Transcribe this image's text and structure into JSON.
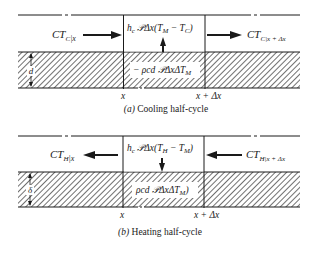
{
  "panels": [
    {
      "id": "cooling",
      "caption_letter": "(a)",
      "caption_text": " Cooling half-cycle",
      "left_flux": {
        "main": "CT",
        "sub": "C",
        "eval": "|x"
      },
      "right_flux": {
        "main": "CT",
        "sub": "C",
        "eval": "|x + Δx"
      },
      "convection_term": {
        "prefix": "h",
        "prefix_sub": "c",
        "body": " 𝒫Δx(T",
        "s1": "M",
        "mid": " − T",
        "s2": "C",
        "end": ")"
      },
      "storage_term": {
        "body": "− ρcd 𝒫ΔxΔT",
        "s1": "M",
        "end": ""
      },
      "flow_direction": "left-to-right",
      "heat_arrow": "up"
    },
    {
      "id": "heating",
      "caption_letter": "(b)",
      "caption_text": " Heating half-cycle",
      "left_flux": {
        "main": "CT",
        "sub": "H",
        "eval": "|x"
      },
      "right_flux": {
        "main": "CT",
        "sub": "H",
        "eval": "|x + Δx"
      },
      "convection_term": {
        "prefix": "h",
        "prefix_sub": "c",
        "body": " 𝒫Δx(T",
        "s1": "H",
        "mid": " − T",
        "s2": "M",
        "end": ")"
      },
      "storage_term": {
        "body": "ρcd 𝒫ΔxΔT",
        "s1": "M",
        "end": ")"
      },
      "flow_direction": "right-to-left",
      "heat_arrow": "down"
    }
  ],
  "axis_labels": {
    "x": "x",
    "x_plus": "x + Δx"
  },
  "thickness_label": {
    "cooling": "d",
    "heating": "δ"
  },
  "colors": {
    "line": "#1a1a1a",
    "hatch": "#333333",
    "background": "#ffffff"
  }
}
